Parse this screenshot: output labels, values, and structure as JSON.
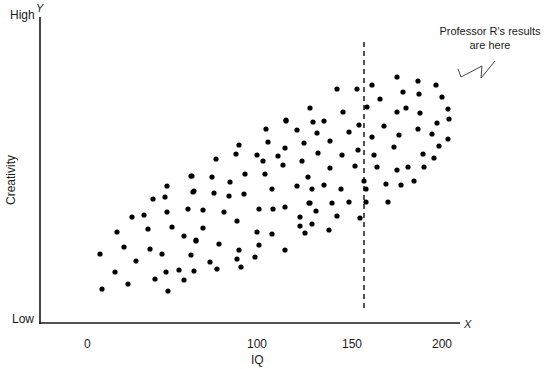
{
  "chart_data": {
    "type": "scatter",
    "title": "",
    "xlabel": "IQ",
    "ylabel": "Creativity",
    "x_axis_symbol": "X",
    "y_axis_symbol": "Y",
    "x_ticks": [
      "0",
      "100",
      "150",
      "200"
    ],
    "y_ticks": [
      "Low",
      "High"
    ],
    "xlim": [
      0,
      200
    ],
    "ylim": [
      "Low",
      "High"
    ],
    "grid": false,
    "legend": null,
    "reference_line": {
      "x": 150,
      "style": "dashed",
      "label": ""
    },
    "annotation": {
      "text_line1": "Professor R's results",
      "text_line2": "are here",
      "pointer": "zig-zag arrow toward upper-right cluster"
    },
    "series": [
      {
        "name": "participants",
        "note": "values are approximate; y on a 0 (Low) to 100 (High) relative scale",
        "points_px": [
          [
            100,
            254
          ],
          [
            102,
            289
          ],
          [
            115,
            272
          ],
          [
            117,
            232
          ],
          [
            124,
            247
          ],
          [
            128,
            284
          ],
          [
            132,
            217
          ],
          [
            136,
            261
          ],
          [
            144,
            215
          ],
          [
            148,
            229
          ],
          [
            150,
            249
          ],
          [
            153,
            199
          ],
          [
            155,
            279
          ],
          [
            162,
            254
          ],
          [
            165,
            197
          ],
          [
            167,
            186
          ],
          [
            167,
            212
          ],
          [
            166,
            272
          ],
          [
            168,
            291
          ],
          [
            172,
            227
          ],
          [
            179,
            270
          ],
          [
            184,
            236
          ],
          [
            184,
            280
          ],
          [
            188,
            209
          ],
          [
            191,
            176
          ],
          [
            191,
            255
          ],
          [
            194,
            191
          ],
          [
            194,
            271
          ],
          [
            196,
            241
          ],
          [
            192,
            176
          ],
          [
            193,
            192
          ],
          [
            203,
            210
          ],
          [
            203,
            228
          ],
          [
            196,
            240
          ],
          [
            210,
            262
          ],
          [
            212,
            177
          ],
          [
            214,
            193
          ],
          [
            216,
            159
          ],
          [
            217,
            269
          ],
          [
            219,
            244
          ],
          [
            224,
            212
          ],
          [
            229,
            196
          ],
          [
            230,
            182
          ],
          [
            236,
            154
          ],
          [
            237,
            221
          ],
          [
            237,
            259
          ],
          [
            239,
            145
          ],
          [
            239,
            250
          ],
          [
            241,
            267
          ],
          [
            244,
            194
          ],
          [
            245,
            174
          ],
          [
            255,
            257
          ],
          [
            257,
            155
          ],
          [
            257,
            232
          ],
          [
            259,
            209
          ],
          [
            259,
            245
          ],
          [
            263,
            161
          ],
          [
            265,
            174
          ],
          [
            266,
            129
          ],
          [
            268,
            142
          ],
          [
            272,
            189
          ],
          [
            272,
            234
          ],
          [
            273,
            209
          ],
          [
            278,
            156
          ],
          [
            283,
            165
          ],
          [
            285,
            148
          ],
          [
            285,
            207
          ],
          [
            285,
            250
          ],
          [
            286,
            120
          ],
          [
            286,
            121
          ],
          [
            297,
            130
          ],
          [
            297,
            186
          ],
          [
            300,
            217
          ],
          [
            300,
            226
          ],
          [
            302,
            161
          ],
          [
            304,
            143
          ],
          [
            305,
            233
          ],
          [
            308,
            177
          ],
          [
            309,
            203
          ],
          [
            310,
            108
          ],
          [
            310,
            203
          ],
          [
            312,
            189
          ],
          [
            312,
            224
          ],
          [
            313,
            122
          ],
          [
            316,
            211
          ],
          [
            317,
            133
          ],
          [
            318,
            153
          ],
          [
            324,
            121
          ],
          [
            324,
            185
          ],
          [
            329,
            230
          ],
          [
            330,
            141
          ],
          [
            330,
            168
          ],
          [
            332,
            203
          ],
          [
            337,
            89
          ],
          [
            337,
            216
          ],
          [
            341,
            189
          ],
          [
            342,
            155
          ],
          [
            343,
            112
          ],
          [
            349,
            132
          ],
          [
            349,
            202
          ],
          [
            355,
            166
          ],
          [
            357,
            89
          ],
          [
            358,
            150
          ],
          [
            359,
            125
          ],
          [
            360,
            218
          ],
          [
            364,
            181
          ],
          [
            366,
            189
          ],
          [
            366,
            202
          ],
          [
            367,
            107
          ],
          [
            372,
            85
          ],
          [
            372,
            137
          ],
          [
            374,
            155
          ],
          [
            377,
            167
          ],
          [
            380,
            99
          ],
          [
            384,
            126
          ],
          [
            386,
            184
          ],
          [
            388,
            202
          ],
          [
            394,
            147
          ],
          [
            397,
            77
          ],
          [
            397,
            112
          ],
          [
            397,
            170
          ],
          [
            399,
            135
          ],
          [
            401,
            185
          ],
          [
            403,
            92
          ],
          [
            406,
            108
          ],
          [
            408,
            167
          ],
          [
            414,
            181
          ],
          [
            418,
            81
          ],
          [
            418,
            129
          ],
          [
            419,
            94
          ],
          [
            420,
            113
          ],
          [
            423,
            154
          ],
          [
            424,
            167
          ],
          [
            432,
            134
          ],
          [
            434,
            158
          ],
          [
            436,
            85
          ],
          [
            437,
            123
          ],
          [
            439,
            146
          ],
          [
            442,
            97
          ],
          [
            448,
            109
          ],
          [
            448,
            139
          ],
          [
            449,
            119
          ]
        ]
      }
    ]
  },
  "labels": {
    "y_high": "High",
    "y_low": "Low",
    "y_symbol": "Y",
    "x_symbol": "X",
    "y_title": "Creativity",
    "x_title": "IQ",
    "x_tick_0": "0",
    "x_tick_100": "100",
    "x_tick_150": "150",
    "x_tick_200": "200",
    "annotation_line1": "Professor R's results",
    "annotation_line2": "are here"
  },
  "colors": {
    "axis": "#1a1a1a",
    "dot": "#000000",
    "text": "#1a1a1a",
    "background": "#ffffff"
  }
}
